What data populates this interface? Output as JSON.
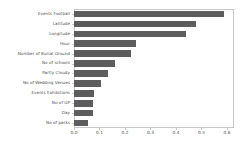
{
  "chart_data": {
    "type": "bar",
    "orientation": "horizontal",
    "title": "",
    "xlabel": "",
    "ylabel": "",
    "xlim": [
      0.0,
      0.6275
    ],
    "grid": false,
    "legend": null,
    "bar_color": "#5d5d5d",
    "frame_color": "#c8c8c8",
    "tick_label_color": "#4d4d4d",
    "xticks": [
      "0.0",
      "0.1",
      "0.2",
      "0.3",
      "0.4",
      "0.5",
      "0.6"
    ],
    "xtick_values": [
      0.0,
      0.1,
      0.2,
      0.3,
      0.4,
      0.5,
      0.6
    ],
    "categories": [
      "Events Football",
      "Latitude",
      "Longitude",
      "Hour",
      "Number of Burial Ground",
      "No of schools",
      "Partly Cloudy",
      "No of Wedding Venues",
      "Events Exhibitions",
      "No of GP",
      "Day",
      "No of parks"
    ],
    "values": [
      0.589,
      0.478,
      0.439,
      0.243,
      0.224,
      0.159,
      0.134,
      0.107,
      0.077,
      0.076,
      0.075,
      0.055
    ]
  }
}
